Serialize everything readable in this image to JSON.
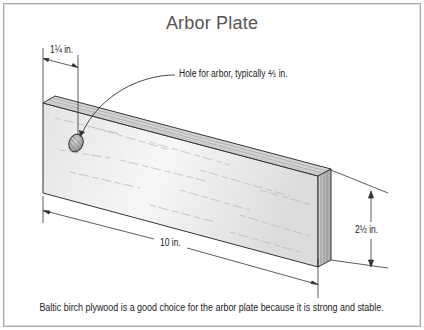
{
  "diagram": {
    "title": "Arbor Plate",
    "labels": {
      "left_offset": "1¼ in.",
      "hole_callout": "Hole for arbor, typically ⅘ in.",
      "height": "2½ in.",
      "length": "10 in."
    },
    "caption": "Baltic birch plywood is a good choice for the arbor plate because it is strong and stable.",
    "object": {
      "name": "arbor plate",
      "material": "Baltic birch plywood",
      "length_in": 10,
      "height_in": 2.5,
      "hole_offset_in": 1.25,
      "hole_diameter_in": 0.625
    },
    "colors": {
      "border": "#a8a8a8",
      "title": "#555555",
      "wood_face": "#ececec",
      "wood_top": "#d2d2d2",
      "wood_end": "#bdbdbd",
      "line": "#333333"
    }
  }
}
